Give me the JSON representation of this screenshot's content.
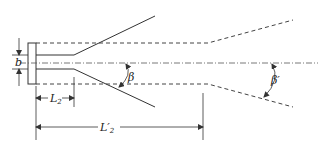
{
  "diagram": {
    "type": "jet-expansion-schematic",
    "labels": {
      "b": "b",
      "L2_main": "L",
      "L2_sub": "2",
      "L2p_main": "L′",
      "L2p_sub": "2",
      "beta": "β",
      "beta_prime": "β′"
    },
    "colors": {
      "line": "#333333",
      "background": "#ffffff"
    }
  }
}
